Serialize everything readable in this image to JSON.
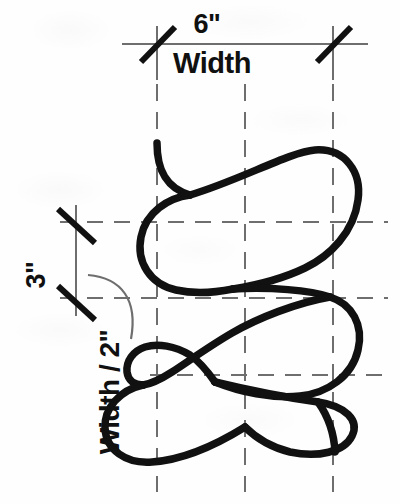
{
  "diagram": {
    "background_color": "#fefefe",
    "ink_color": "#111111",
    "guide_color": "#6a6a6a",
    "dimensions": {
      "width_value": "6\"",
      "width_label": "Width",
      "height_value": "3\"",
      "half_width_label": "Width / 2\""
    },
    "guides": {
      "vertical_lines_x": [
        157,
        245,
        333
      ],
      "horizontal_lines_y": [
        222,
        298,
        375
      ],
      "top_dimension_line_y": 44,
      "left_dimension_line_x": 76
    },
    "motif": {
      "type": "serpentine-teardrop-loop",
      "loop_count": 4,
      "description": "Continuous wave of alternating left and right pointing teardrop loops pinched at the guide lines"
    }
  }
}
